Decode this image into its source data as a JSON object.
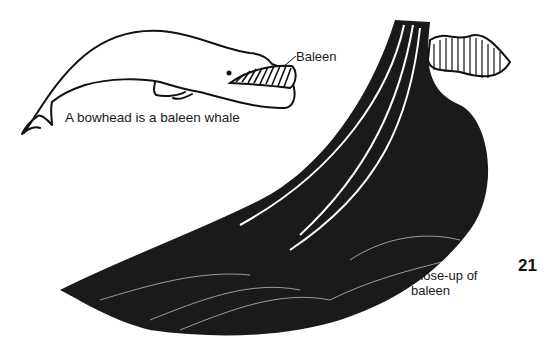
{
  "page": {
    "page_number": "21"
  },
  "whale_figure": {
    "caption": "A bowhead is a baleen whale",
    "callout_label": "Baleen"
  },
  "baleen_figure": {
    "caption_line1": "Close-up of",
    "caption_line2": "baleen"
  },
  "colors": {
    "ink": "#111111",
    "paper": "#ffffff"
  }
}
